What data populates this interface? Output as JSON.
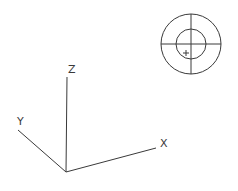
{
  "axes": {
    "x_label": "X",
    "y_label": "Y",
    "z_label": "Z"
  },
  "compass": {
    "marker": "+"
  },
  "colors": {
    "line": "#3a3a3a",
    "background": "#ffffff"
  }
}
